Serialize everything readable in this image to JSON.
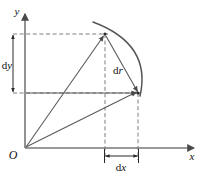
{
  "figure": {
    "type": "geometry-diagram",
    "topic": "differential-displacement-vector",
    "background_color": "#ffffff",
    "stroke_color": "#4a4a4a",
    "dash_color": "#6e6e6e",
    "text_color": "#111111",
    "axes": {
      "x_label": "x",
      "y_label": "y",
      "origin_label": "O",
      "x_axis": {
        "x1": 25,
        "y1": 148,
        "x2": 196,
        "y2": 148
      },
      "y_axis": {
        "x1": 25,
        "y1": 148,
        "x2": 25,
        "y2": 12
      }
    },
    "points": {
      "origin": {
        "name": "O",
        "x": 25,
        "y": 148
      },
      "upper": {
        "name": "P1",
        "x": 105,
        "y": 34
      },
      "lower_right": {
        "name": "P2",
        "x": 138,
        "y": 93
      }
    },
    "vectors": [
      {
        "name": "r-vector-upper",
        "from": [
          25,
          148
        ],
        "to": [
          105,
          34
        ]
      },
      {
        "name": "r-vector-lower",
        "from": [
          25,
          148
        ],
        "to": [
          138,
          93
        ]
      },
      {
        "name": "dr-vector",
        "from": [
          105,
          34
        ],
        "to": [
          138,
          93
        ]
      },
      {
        "name": "dx-horizontal-vector",
        "from": [
          25,
          93
        ],
        "to": [
          138,
          93
        ]
      }
    ],
    "arc": {
      "name": "trajectory-arc",
      "start": [
        93,
        22
      ],
      "control": [
        152,
        44
      ],
      "end": [
        140,
        95
      ]
    },
    "dashed_lines": [
      {
        "name": "dy-top-guide",
        "x1": 13,
        "y1": 34,
        "x2": 108,
        "y2": 34
      },
      {
        "name": "dy-bottom-guide",
        "x1": 13,
        "y1": 93,
        "x2": 141,
        "y2": 93
      },
      {
        "name": "dx-left-guide",
        "x1": 105,
        "y1": 34,
        "x2": 105,
        "y2": 160
      },
      {
        "name": "dx-right-guide",
        "x1": 138,
        "y1": 93,
        "x2": 138,
        "y2": 160
      }
    ],
    "measures": [
      {
        "name": "dy-measure",
        "label": "dy",
        "label_prefix": "d",
        "label_var": "y",
        "orientation": "vertical",
        "x": 13,
        "y_start": 32,
        "y_end": 94,
        "label_x": 8,
        "label_y": 66
      },
      {
        "name": "dx-measure",
        "label": "dx",
        "label_prefix": "d",
        "label_var": "x",
        "orientation": "horizontal",
        "y": 156,
        "x_start": 104,
        "x_end": 139,
        "label_x": 121,
        "label_y": 170
      }
    ],
    "annotations": [
      {
        "name": "dr-label",
        "label": "dr",
        "label_prefix": "d",
        "label_var": "r",
        "x": 118,
        "y": 71
      }
    ],
    "caption": {
      "text": "",
      "visible": false
    }
  }
}
